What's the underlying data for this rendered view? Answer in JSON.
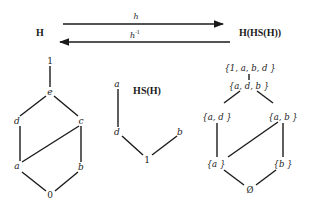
{
  "top": {
    "left_label": "H",
    "right_label": "H(HS(H))",
    "forward_map_label": "h",
    "inverse_map_label": "h",
    "inverse_superscript": "-1"
  },
  "left_lattice": {
    "nodes": {
      "top": "1",
      "e": "e",
      "d": "d",
      "c": "c",
      "a": "a",
      "b": "b",
      "bottom": "0"
    },
    "edges": [
      [
        "1",
        "e"
      ],
      [
        "e",
        "d"
      ],
      [
        "e",
        "c"
      ],
      [
        "d",
        "a"
      ],
      [
        "c",
        "a"
      ],
      [
        "c",
        "b"
      ],
      [
        "a",
        "0"
      ],
      [
        "b",
        "0"
      ]
    ]
  },
  "middle_poset": {
    "title": "HS(H)",
    "nodes": {
      "a": "a",
      "d": "d",
      "b": "b",
      "one": "1"
    },
    "edges": [
      [
        "a",
        "d"
      ],
      [
        "d",
        "1"
      ],
      [
        "b",
        "1"
      ]
    ]
  },
  "right_lattice": {
    "nodes": {
      "top": "{1, a, b, d }",
      "adb": "{a, d, b }",
      "ad": "{a, d }",
      "ab": "{a, b }",
      "a": "{a }",
      "b": "{b }",
      "empty": "Ø"
    },
    "edges": [
      [
        "top",
        "adb"
      ],
      [
        "adb",
        "ad"
      ],
      [
        "adb",
        "ab"
      ],
      [
        "ad",
        "a"
      ],
      [
        "ab",
        "a"
      ],
      [
        "ab",
        "b"
      ],
      [
        "a",
        "empty"
      ],
      [
        "b",
        "empty"
      ]
    ]
  },
  "colors": {
    "ink": "#1a1a1a",
    "background": "#ffffff"
  }
}
